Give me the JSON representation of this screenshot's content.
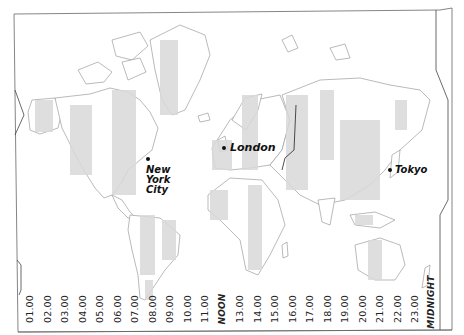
{
  "map": {
    "title": "World time zones",
    "colors": {
      "land_zone_a": "#d9d9d9",
      "land_zone_b": "#ffffff",
      "coastline": "#8c8c8c",
      "border": "#555555",
      "text": "#222222"
    },
    "cities": [
      {
        "name": "New York City",
        "lines": [
          "New",
          "York",
          "City"
        ]
      },
      {
        "name": "London",
        "lines": [
          "London"
        ]
      },
      {
        "name": "Tokyo",
        "lines": [
          "Tokyo"
        ]
      }
    ],
    "hours": [
      "01.00",
      "02.00",
      "03.00",
      "04.00",
      "05.00",
      "06.00",
      "07.00",
      "08.00",
      "09.00",
      "10.00",
      "11.00",
      "NOON",
      "13.00",
      "14.00",
      "15.00",
      "16.00",
      "17.00",
      "18.00",
      "19.00",
      "20.00",
      "21.00",
      "22.00",
      "23.00",
      "MIDNIGHT"
    ]
  }
}
